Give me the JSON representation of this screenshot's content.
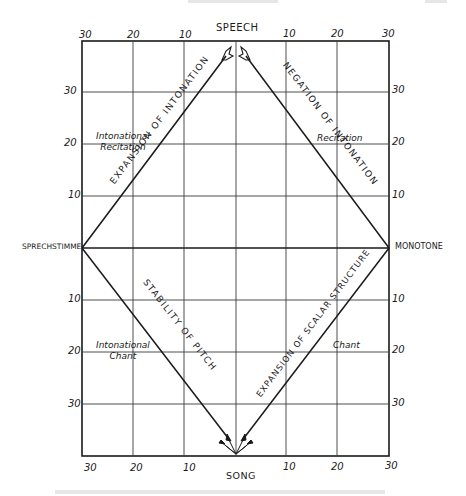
{
  "diagram": {
    "poles": {
      "top": "SPEECH",
      "bottom": "SONG",
      "left": "SPRECHSTIMME",
      "right": "MONOTONE"
    },
    "edges": {
      "upper_left": "EXPANSION  OF  INTONATION",
      "upper_right": "NEGATION  OF  INTONATION",
      "lower_left": "STABILITY  OF  PITCH",
      "lower_right": "EXPANSION  OF  SCALAR  STRUCTURE"
    },
    "regions": {
      "upper_left_line1": "Intonational",
      "upper_left_line2": "Recitation",
      "upper_right": "Recitation",
      "lower_left_line1": "Intonational",
      "lower_left_line2": "Chant",
      "lower_right": "Chant"
    },
    "axes": {
      "top_ticks": [
        "30",
        "20",
        "10",
        "10",
        "20",
        "30"
      ],
      "bottom_ticks": [
        "30",
        "20",
        "10",
        "10",
        "20",
        "30"
      ],
      "left_ticks": [
        "30",
        "20",
        "10",
        "10",
        "20",
        "30"
      ],
      "right_ticks": [
        "30",
        "20",
        "10",
        "10",
        "20",
        "30"
      ]
    },
    "colors": {
      "ink": "#1a1a1a",
      "grid": "#3a3a3a",
      "background": "#ffffff"
    }
  }
}
